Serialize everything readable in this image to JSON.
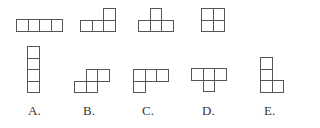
{
  "diagram": {
    "cell_size": 11.5,
    "stroke_color": "#555555",
    "text_color": "#333333",
    "given_pieces": [
      {
        "name": "piece-1-i-horizontal",
        "cells": [
          [
            0,
            0
          ],
          [
            1,
            0
          ],
          [
            2,
            0
          ],
          [
            3,
            0
          ]
        ],
        "origin": [
          16,
          19
        ]
      },
      {
        "name": "piece-2-l",
        "cells": [
          [
            2,
            0
          ],
          [
            0,
            1
          ],
          [
            1,
            1
          ],
          [
            2,
            1
          ]
        ],
        "origin": [
          80,
          8
        ]
      },
      {
        "name": "piece-3-t",
        "cells": [
          [
            1,
            0
          ],
          [
            0,
            1
          ],
          [
            1,
            1
          ],
          [
            2,
            1
          ]
        ],
        "origin": [
          138,
          8
        ]
      },
      {
        "name": "piece-4-square",
        "cells": [
          [
            0,
            0
          ],
          [
            1,
            0
          ],
          [
            0,
            1
          ],
          [
            1,
            1
          ]
        ],
        "origin": [
          201,
          8
        ]
      }
    ],
    "options": [
      {
        "label": "A.",
        "cells": [
          [
            0,
            0
          ],
          [
            0,
            1
          ],
          [
            0,
            2
          ],
          [
            0,
            3
          ]
        ],
        "origin": [
          27,
          46
        ],
        "label_x": 28
      },
      {
        "label": "B.",
        "cells": [
          [
            1,
            0
          ],
          [
            2,
            0
          ],
          [
            0,
            1
          ],
          [
            1,
            1
          ]
        ],
        "origin": [
          74,
          69
        ],
        "label_x": 83
      },
      {
        "label": "C.",
        "cells": [
          [
            0,
            0
          ],
          [
            1,
            0
          ],
          [
            2,
            0
          ],
          [
            0,
            1
          ]
        ],
        "origin": [
          133,
          69
        ],
        "label_x": 142
      },
      {
        "label": "D.",
        "cells": [
          [
            0,
            0
          ],
          [
            1,
            0
          ],
          [
            2,
            0
          ],
          [
            1,
            1
          ]
        ],
        "origin": [
          191,
          68
        ],
        "label_x": 202
      },
      {
        "label": "E.",
        "cells": [
          [
            0,
            0
          ],
          [
            0,
            1
          ],
          [
            0,
            2
          ],
          [
            1,
            2
          ]
        ],
        "origin": [
          260,
          57
        ],
        "label_x": 264
      }
    ]
  }
}
